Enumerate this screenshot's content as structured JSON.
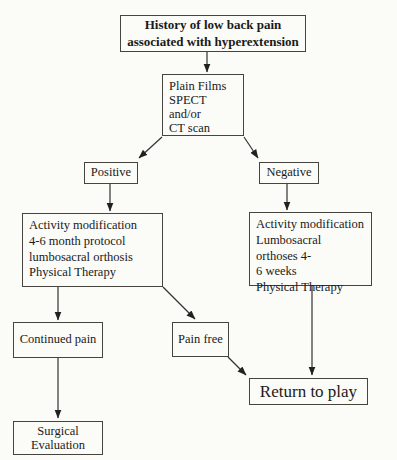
{
  "diagram": {
    "type": "flowchart",
    "title": "History of low back pain associated with hyperextension",
    "colors": {
      "background": "#fbfbf8",
      "line": "#333231",
      "text": "#1a1a1a",
      "box_border": "#45443f"
    },
    "nodes": {
      "history": "History of low back pain\nassociated with hyperextension",
      "imaging": "Plain Films\nSPECT\nand/or\nCT scan",
      "positive": "Positive",
      "negative": "Negative",
      "positive_treatment": "Activity modification\n4-6 month protocol\nlumbosacral orthosis\nPhysical Therapy",
      "negative_treatment": "Activity modification\nLumbosacral orthoses 4-\n6 weeks\nPhysical Therapy",
      "continued_pain": "Continued pain",
      "pain_free": "Pain free",
      "return_to_play": "Return to play",
      "surgical_evaluation": "Surgical\nEvaluation"
    },
    "edges": [
      {
        "from": "history",
        "to": "imaging"
      },
      {
        "from": "imaging",
        "to": "positive"
      },
      {
        "from": "imaging",
        "to": "negative"
      },
      {
        "from": "positive",
        "to": "positive_treatment"
      },
      {
        "from": "negative",
        "to": "negative_treatment"
      },
      {
        "from": "positive_treatment",
        "to": "continued_pain"
      },
      {
        "from": "positive_treatment",
        "to": "pain_free"
      },
      {
        "from": "pain_free",
        "to": "return_to_play"
      },
      {
        "from": "negative_treatment",
        "to": "return_to_play"
      },
      {
        "from": "continued_pain",
        "to": "surgical_evaluation"
      }
    ]
  }
}
